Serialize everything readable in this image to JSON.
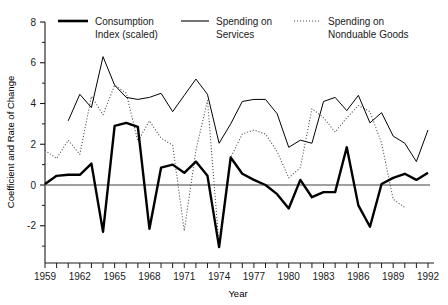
{
  "chart_data": {
    "type": "line",
    "title": "",
    "xlabel": "Year",
    "ylabel": "Coefficient and Rate of Change",
    "xlim": [
      1959,
      1992.5
    ],
    "ylim": [
      -3.1,
      8.0
    ],
    "yticks": [
      -2,
      0,
      2,
      4,
      6,
      8
    ],
    "ytick_labels": [
      "-2",
      "0",
      "2",
      "4",
      "6",
      "8"
    ],
    "yminor_ticks": [
      -3,
      -1,
      1,
      3,
      5,
      7
    ],
    "xticks": [
      1959,
      1960,
      1961,
      1962,
      1963,
      1964,
      1965,
      1966,
      1967,
      1968,
      1969,
      1970,
      1971,
      1972,
      1973,
      1974,
      1975,
      1976,
      1977,
      1978,
      1979,
      1980,
      1981,
      1982,
      1983,
      1984,
      1985,
      1986,
      1987,
      1988,
      1989,
      1990,
      1991,
      1992
    ],
    "xtick_labels_shown": [
      "1959",
      "1962",
      "1965",
      "1968",
      "1971",
      "1974",
      "1977",
      "1980",
      "1983",
      "1986",
      "1989",
      "1992"
    ],
    "xtick_label_years": [
      1959,
      1962,
      1965,
      1968,
      1971,
      1974,
      1977,
      1980,
      1983,
      1986,
      1989,
      1992
    ],
    "grid": false,
    "zero_line": 0,
    "legend_position": "top",
    "x": [
      1959,
      1960,
      1961,
      1962,
      1963,
      1964,
      1965,
      1966,
      1967,
      1968,
      1969,
      1970,
      1971,
      1972,
      1973,
      1974,
      1975,
      1976,
      1977,
      1978,
      1979,
      1980,
      1981,
      1982,
      1983,
      1984,
      1985,
      1986,
      1987,
      1988,
      1989,
      1990,
      1991,
      1992
    ],
    "series": [
      {
        "name": "Consumption Index (scaled)",
        "style": "bold-solid",
        "color": "#000000",
        "width": 2.4,
        "values": [
          0.05,
          0.45,
          0.5,
          0.5,
          1.05,
          -2.3,
          2.9,
          3.05,
          2.85,
          -2.15,
          0.85,
          1.0,
          0.6,
          1.15,
          0.45,
          -3.05,
          1.35,
          0.55,
          0.25,
          0.0,
          -0.45,
          -1.15,
          0.25,
          -0.6,
          -0.35,
          -0.35,
          1.85,
          -1.0,
          -2.05,
          0.05,
          0.35,
          0.55,
          0.25,
          0.6
        ]
      },
      {
        "name": "Spending on Services",
        "style": "thin-solid",
        "color": "#000000",
        "width": 1.0,
        "values": [
          null,
          null,
          3.15,
          4.45,
          3.8,
          6.3,
          4.9,
          4.3,
          4.2,
          4.3,
          4.5,
          3.6,
          4.4,
          5.2,
          4.45,
          2.05,
          3.0,
          4.1,
          4.2,
          4.2,
          3.5,
          1.85,
          2.2,
          2.05,
          4.1,
          4.3,
          3.65,
          4.4,
          3.05,
          3.55,
          2.4,
          2.05,
          1.15,
          2.7
        ]
      },
      {
        "name": "Spending on Nonduable Goods",
        "label": "Spending on Nonduable Goods",
        "style": "dotted",
        "color": "#4d4d4d",
        "width": 1.0,
        "values": [
          1.7,
          1.3,
          2.2,
          1.5,
          4.35,
          3.45,
          4.9,
          4.5,
          2.15,
          3.15,
          2.3,
          1.95,
          -2.25,
          1.7,
          4.15,
          -3.0,
          1.35,
          2.5,
          2.7,
          2.5,
          1.65,
          0.35,
          0.85,
          3.75,
          3.3,
          2.6,
          3.3,
          3.9,
          3.6,
          2.05,
          -0.7,
          -1.1,
          null,
          null
        ]
      }
    ],
    "legend": [
      {
        "label_line1": "Consumption",
        "label_line2": "Index (scaled)",
        "style": "bold-solid"
      },
      {
        "label_line1": "Spending on",
        "label_line2": "Services",
        "style": "thin-solid"
      },
      {
        "label_line1": "Spending on",
        "label_line2": "Nonduable Goods",
        "style": "dotted"
      }
    ]
  },
  "axis": {
    "xlabel": "Year",
    "ylabel": "Coefficient and Rate of Change",
    "y_tick_labels": [
      "8",
      "6",
      "4",
      "2",
      "0",
      "-2"
    ],
    "x_tick_labels": [
      "1959",
      "1962",
      "1965",
      "1968",
      "1971",
      "1974",
      "1977",
      "1980",
      "1983",
      "1986",
      "1989",
      "1992"
    ]
  },
  "legend": {
    "item1_line1": "Consumption",
    "item1_line2": "Index (scaled)",
    "item2_line1": "Spending on",
    "item2_line2": "Services",
    "item3_line1": "Spending on",
    "item3_line2": "Nonduable Goods"
  },
  "colors": {
    "bold_series": "#000000",
    "thin_series": "#000000",
    "dotted_series": "#4d4d4d",
    "axis": "#1a1a1a",
    "zero_line": "#808080",
    "background": "#ffffff"
  }
}
